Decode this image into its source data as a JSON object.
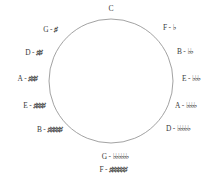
{
  "diagram": {
    "name": "circle-of-fifths",
    "background_color": "#ffffff",
    "circle": {
      "center_x": 111,
      "center_y": 81,
      "radius": 62,
      "stroke_color": "#8a8a8a",
      "stroke_width": 0.8,
      "fill": "none"
    },
    "text_color": "#3a3a3a",
    "sharp_symbol": "♯",
    "flat_symbol": "♭",
    "separator": "-"
  },
  "keys": [
    {
      "id": "key-c",
      "tonic": "C",
      "accidental": "",
      "signature": "",
      "accidental_count": 0,
      "accidental_type": "none",
      "label": "C",
      "position": "top",
      "anchor": "mid",
      "x": 111,
      "y": 9
    },
    {
      "id": "key-g",
      "tonic": "G",
      "accidental": "",
      "signature": "♯",
      "accidental_count": 1,
      "accidental_type": "sharp",
      "label": "G - ♯",
      "position": "upper-left",
      "anchor": "right",
      "x": 57,
      "y": 30
    },
    {
      "id": "key-d",
      "tonic": "D",
      "accidental": "",
      "signature": "♯♯",
      "accidental_count": 2,
      "accidental_type": "sharp",
      "label": "D - ♯♯",
      "position": "upper-left",
      "anchor": "right",
      "x": 42,
      "y": 53
    },
    {
      "id": "key-a",
      "tonic": "A",
      "accidental": "",
      "signature": "♯♯♯",
      "accidental_count": 3,
      "accidental_type": "sharp",
      "label": "A - ♯♯♯",
      "position": "left",
      "anchor": "right",
      "x": 37,
      "y": 79
    },
    {
      "id": "key-e",
      "tonic": "E",
      "accidental": "",
      "signature": "♯♯♯♯",
      "accidental_count": 4,
      "accidental_type": "sharp",
      "label": "E - ♯♯♯♯",
      "position": "lower-left",
      "anchor": "right",
      "x": 45,
      "y": 106
    },
    {
      "id": "key-b",
      "tonic": "B",
      "accidental": "",
      "signature": "♯♯♯♯♯",
      "accidental_count": 5,
      "accidental_type": "sharp",
      "label": "B - ♯♯♯♯♯",
      "position": "lower-left",
      "anchor": "right",
      "x": 62,
      "y": 130
    },
    {
      "id": "key-f-sharp",
      "tonic": "F",
      "accidental": "♯",
      "signature": "♯♯♯♯♯♯",
      "accidental_count": 6,
      "accidental_type": "sharp",
      "label": "F♯ - ♯♯♯♯♯♯",
      "position": "bottom",
      "anchor": "mid",
      "x": 113,
      "y": 170
    },
    {
      "id": "key-g-flat",
      "tonic": "G",
      "accidental": "♭",
      "signature": "♭♭♭♭♭♭",
      "accidental_count": 6,
      "accidental_type": "flat",
      "label": "G♭ - ♭♭♭♭♭♭",
      "position": "bottom",
      "anchor": "mid",
      "x": 115,
      "y": 157
    },
    {
      "id": "key-d-flat",
      "tonic": "D",
      "accidental": "♭",
      "signature": "♭♭♭♭♭",
      "accidental_count": 5,
      "accidental_type": "flat",
      "label": "D♭ - ♭♭♭♭♭",
      "position": "lower-right",
      "anchor": "left",
      "x": 166,
      "y": 129
    },
    {
      "id": "key-a-flat",
      "tonic": "A",
      "accidental": "♭",
      "signature": "♭♭♭♭",
      "accidental_count": 4,
      "accidental_type": "flat",
      "label": "A♭ - ♭♭♭♭",
      "position": "lower-right",
      "anchor": "left",
      "x": 175,
      "y": 106
    },
    {
      "id": "key-e-flat",
      "tonic": "E",
      "accidental": "♭",
      "signature": "♭♭♭",
      "accidental_count": 3,
      "accidental_type": "flat",
      "label": "E♭ - ♭♭♭",
      "position": "right",
      "anchor": "left",
      "x": 182,
      "y": 79
    },
    {
      "id": "key-b-flat",
      "tonic": "B",
      "accidental": "♭",
      "signature": "♭♭",
      "accidental_count": 2,
      "accidental_type": "flat",
      "label": "B♭ - ♭♭",
      "position": "upper-right",
      "anchor": "left",
      "x": 177,
      "y": 52
    },
    {
      "id": "key-f",
      "tonic": "F",
      "accidental": "",
      "signature": "♭",
      "accidental_count": 1,
      "accidental_type": "flat",
      "label": "F - ♭",
      "position": "upper-right",
      "anchor": "left",
      "x": 163,
      "y": 28
    }
  ]
}
